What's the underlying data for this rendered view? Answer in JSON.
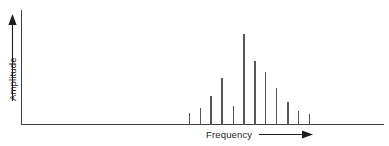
{
  "figure": {
    "background_color": "#ffffff",
    "line_color": "#3f3f3f",
    "spike_color": "#555555",
    "label_color": "#1d1d1d",
    "y_axis_label": "Amplitude",
    "x_axis_label": "Frequency",
    "y_arrow_icon": "arrow-up-icon",
    "x_arrow_icon": "arrow-right-icon"
  },
  "chart_data": {
    "type": "bar",
    "title": "",
    "subtitle": "",
    "xlabel": "Frequency",
    "ylabel": "Amplitude",
    "grid": false,
    "legend": "none",
    "annotations": [],
    "axis_style": "arrows-only, no tick marks, no tick labels",
    "xlim": [
      0,
      100
    ],
    "ylim": [
      0,
      100
    ],
    "x_tick_labels": [],
    "y_tick_labels": [],
    "categories": [
      "f1",
      "f2",
      "f3",
      "f4",
      "f5",
      "f6",
      "f7",
      "f8",
      "f9",
      "f10",
      "f11",
      "f12"
    ],
    "x": [
      46.3,
      49.3,
      52.3,
      55.3,
      58.4,
      61.4,
      64.4,
      67.4,
      70.4,
      73.5,
      76.5,
      79.5
    ],
    "values": [
      10,
      14,
      25,
      41,
      16,
      79,
      55,
      46,
      32,
      20,
      12,
      9
    ],
    "peak_index": 5,
    "peak_value": 79
  }
}
